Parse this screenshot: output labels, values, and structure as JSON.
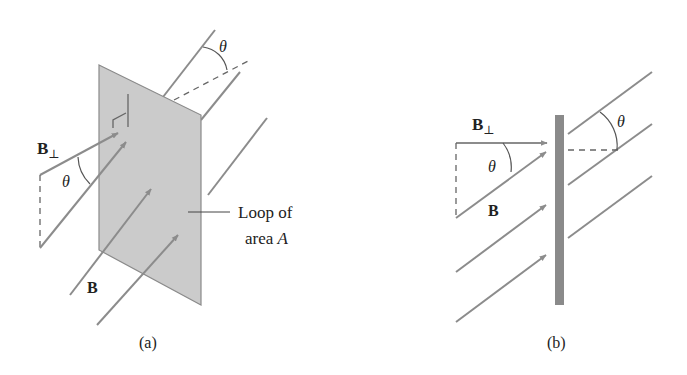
{
  "figure": {
    "panel_a": {
      "caption": "(a)",
      "labels": {
        "b_perp": "B",
        "b_perp_sub": "⊥",
        "b": "B",
        "theta_left": "θ",
        "theta_top": "θ",
        "loop_line1": "Loop of",
        "loop_line2_prefix": "area ",
        "loop_line2_var": "A"
      }
    },
    "panel_b": {
      "caption": "(b)",
      "labels": {
        "b_perp": "B",
        "b_perp_sub": "⊥",
        "b": "B",
        "theta_left": "θ",
        "theta_right": "θ"
      }
    },
    "colors": {
      "plate_fill": "#c8c8c8",
      "plate_edge": "#8a8a8a",
      "field_line": "#8c8c8c",
      "bar": "#8a8a8a",
      "text": "#222222"
    }
  }
}
